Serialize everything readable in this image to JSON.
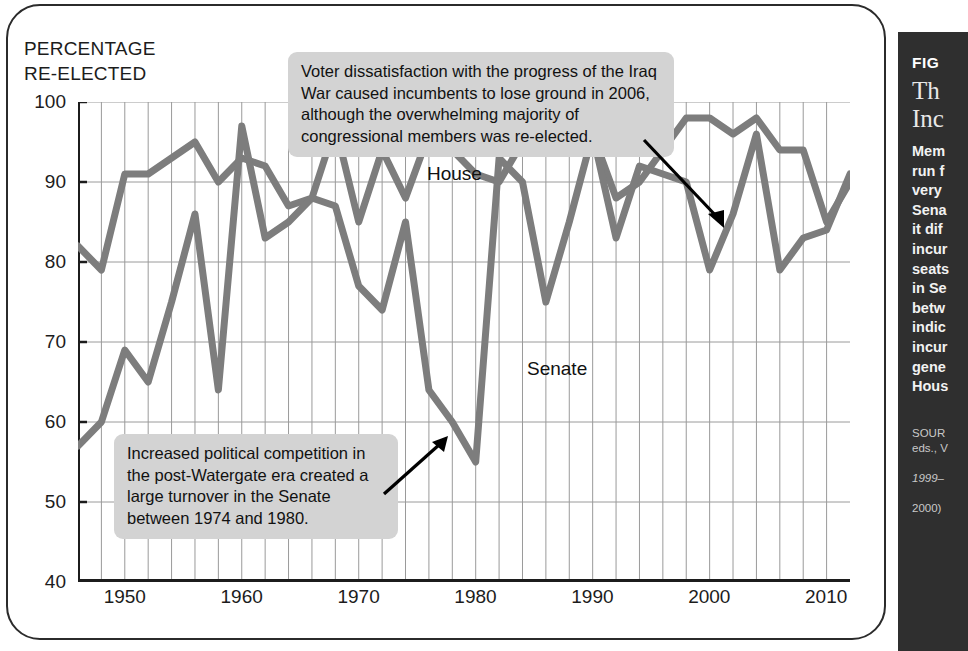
{
  "figure": {
    "axis_title": "PERCENTAGE\nRE-ELECTED"
  },
  "annotations": {
    "iraq": "Voter dissatisfaction with the progress of the Iraq War caused incumbents to lose ground in 2006, although the overwhelming majority of congressional members was re-elected.",
    "watergate": "Increased political competition in the post-Watergate era created a large turnover in the Senate between 1974 and 1980."
  },
  "sidebar": {
    "figure_label": "FIG",
    "title": "Th\nInc",
    "body": "Mem\nrun f\nvery\nSena\nit dif\nincur\nseats\nin Se\nbetw\nindic\nincur\ngene\nHous",
    "source_label": "SOUR",
    "source_line2": "eds., V",
    "source_line3": "1999–",
    "source_line4": "2000)"
  },
  "chart_data": {
    "type": "line",
    "title": "Percentage Re-elected",
    "xlabel": "",
    "ylabel": "PERCENTAGE RE-ELECTED",
    "xlim": [
      1946,
      2012
    ],
    "ylim": [
      40,
      100
    ],
    "yticks": [
      40,
      50,
      60,
      70,
      80,
      90,
      100
    ],
    "xticks": [
      1950,
      1960,
      1970,
      1980,
      1990,
      2000,
      2010
    ],
    "grid": true,
    "gridline_interval_years": 2,
    "legend": "inline-labels",
    "series_labels": {
      "house": "House",
      "senate": "Senate"
    },
    "line_color": "#7d7d7d",
    "x": [
      1946,
      1948,
      1950,
      1952,
      1954,
      1956,
      1958,
      1960,
      1962,
      1964,
      1966,
      1968,
      1970,
      1972,
      1974,
      1976,
      1978,
      1980,
      1982,
      1984,
      1986,
      1988,
      1990,
      1992,
      1994,
      1996,
      1998,
      2000,
      2002,
      2004,
      2006,
      2008,
      2010,
      2012
    ],
    "series": [
      {
        "name": "House",
        "values": [
          82,
          79,
          91,
          91,
          93,
          95,
          90,
          93,
          92,
          87,
          88,
          97,
          85,
          94,
          88,
          96,
          94,
          91,
          90,
          95,
          98,
          98,
          96,
          88,
          90,
          94,
          98,
          98,
          96,
          98,
          94,
          94,
          85,
          90
        ]
      },
      {
        "name": "Senate",
        "values": [
          57,
          60,
          69,
          65,
          75,
          86,
          64,
          97,
          83,
          85,
          88,
          87,
          77,
          74,
          85,
          64,
          60,
          55,
          93,
          90,
          75,
          85,
          96,
          83,
          92,
          91,
          90,
          79,
          86,
          96,
          79,
          83,
          84,
          91
        ]
      }
    ]
  }
}
